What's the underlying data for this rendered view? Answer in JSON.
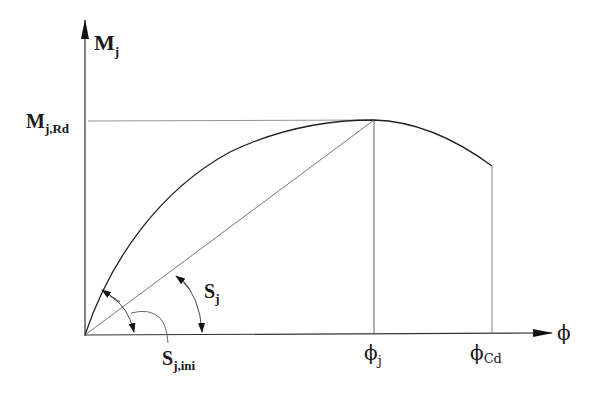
{
  "diagram": {
    "axes": {
      "y_label": "M",
      "y_label_sub": "j",
      "x_label": "ϕ"
    },
    "labels": {
      "moment_resistance": {
        "main": "M",
        "sub": "j,Rd"
      },
      "secant_stiffness": {
        "main": "S",
        "sub": "j"
      },
      "initial_stiffness": {
        "main": "S",
        "sub": "j,ini"
      },
      "rotation_j": {
        "main": "ϕ",
        "sub": "j"
      },
      "rotation_cd": {
        "main": "ϕ",
        "sub": "Cd"
      }
    },
    "colors": {
      "line": "#2a2a2a",
      "thin_line": "#555555",
      "background": "#ffffff"
    }
  }
}
